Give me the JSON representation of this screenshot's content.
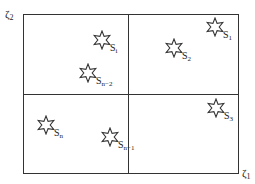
{
  "diagram": {
    "axes": {
      "y_label": {
        "base": "ζ",
        "sub": "2"
      },
      "x_label": {
        "base": "ζ",
        "sub": "1"
      }
    },
    "quadrants": [
      "top-left",
      "top-right",
      "bottom-left",
      "bottom-right"
    ],
    "stars": [
      {
        "id": "s-i",
        "base": "S",
        "sub": "i",
        "x": 102,
        "y": 40,
        "quadrant": "top-left"
      },
      {
        "id": "s-n-2",
        "base": "S",
        "sub": "n−2",
        "x": 88,
        "y": 73,
        "quadrant": "top-left"
      },
      {
        "id": "s-2",
        "base": "S",
        "sub": "2",
        "x": 174,
        "y": 48,
        "quadrant": "top-right"
      },
      {
        "id": "s-1",
        "base": "S",
        "sub": "1",
        "x": 215,
        "y": 27,
        "quadrant": "top-right"
      },
      {
        "id": "s-n",
        "base": "S",
        "sub": "n",
        "x": 46,
        "y": 125,
        "quadrant": "bottom-left"
      },
      {
        "id": "s-n-1",
        "base": "S",
        "sub": "n−1",
        "x": 110,
        "y": 137,
        "quadrant": "bottom-left"
      },
      {
        "id": "s-3",
        "base": "S",
        "sub": "3",
        "x": 216,
        "y": 108,
        "quadrant": "bottom-right"
      }
    ],
    "colors": {
      "stroke": "#333333",
      "background": "#ffffff"
    }
  }
}
